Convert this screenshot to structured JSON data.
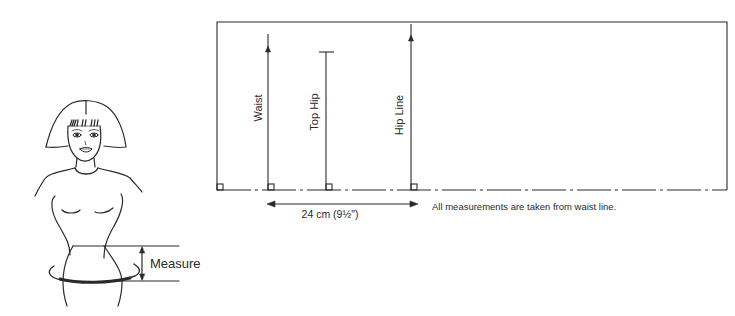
{
  "figure": {
    "measure_label": "Measure"
  },
  "pattern": {
    "lines": [
      {
        "label": "Waist",
        "x": 268,
        "top": 34,
        "marker": "arrow"
      },
      {
        "label": "Top Hip",
        "x": 326,
        "top": 52,
        "marker": "tick"
      },
      {
        "label": "Hip Line",
        "x": 411,
        "top": 24,
        "marker": "arrow"
      }
    ],
    "dimension": "24 cm (9½\")",
    "note": "All measurements are taken from waist line."
  },
  "colors": {
    "ink": "#2a2a2a",
    "background": "#ffffff"
  }
}
